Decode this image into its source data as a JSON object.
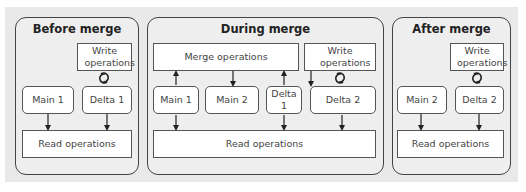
{
  "panels": {
    "before": {
      "title": "Before merge",
      "write_ops": "Write operations",
      "main": "Main 1",
      "delta": "Delta 1",
      "read_ops": "Read operations"
    },
    "during": {
      "title": "During merge",
      "merge_ops": "Merge operations",
      "write_ops": "Write operations",
      "main1": "Main 1",
      "main2": "Main 2",
      "delta1": "Delta 1",
      "delta2": "Delta 2",
      "read_ops": "Read operations"
    },
    "after": {
      "title": "After merge",
      "write_ops": "Write operations",
      "main": "Main 2",
      "delta": "Delta 2",
      "read_ops": "Read operations"
    }
  },
  "icons": {
    "cycle": "cycle-arrows-icon",
    "arrow": "arrow-down-icon"
  },
  "colors": {
    "background": "#e9e9e9",
    "panel_fill": "#eeeeee",
    "box_fill": "#ffffff",
    "stroke": "#444444"
  }
}
